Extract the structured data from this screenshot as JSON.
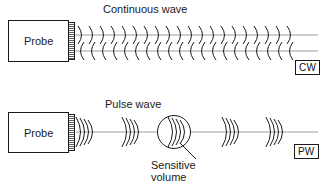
{
  "figure": {
    "width": 324,
    "height": 185,
    "background_color": "#ffffff",
    "line_color": "#1a1a1a",
    "axis_color": "#8a8a8a"
  },
  "rows": [
    {
      "id": "continuous-wave",
      "heading": "Continuous wave",
      "probe_label": "Probe",
      "badge": "CW",
      "description": "Probe emitting an uninterrupted train of arcs along two parallel beam lines"
    },
    {
      "id": "pulse-wave",
      "heading": "Pulse wave",
      "probe_label": "Probe",
      "badge": "PW",
      "description": "Probe emitting discrete wave packets along a single beam line",
      "callout": {
        "line1": "Sensitive",
        "line2": "volume"
      }
    }
  ],
  "icons": {
    "wave_arc": "wave-arc-icon",
    "transducer_hatch": "transducer-hatch-icon",
    "sensitive_volume": "sensitive-volume-circle-icon",
    "leader_line": "callout-leader-line-icon"
  }
}
